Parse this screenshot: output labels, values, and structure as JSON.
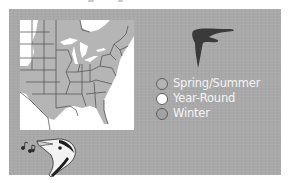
{
  "figure": {
    "title_cropped": "",
    "panel_color": "#a9a9a9",
    "map": {
      "region": "Eastern United States",
      "range_fill": "#b5b5b5",
      "background_fill": "#ffffff",
      "border_color": "#4a4a4a"
    },
    "icons": {
      "flight_silhouette": "swift-silhouette-icon",
      "bird_head": "singing-bird-head-icon",
      "music_notes": "music-notes-icon"
    },
    "legend": {
      "items": [
        {
          "label": "Spring/Summer",
          "swatch": "#b3b3b3"
        },
        {
          "label": "Year-Round",
          "swatch": "#ffffff"
        },
        {
          "label": "Winter",
          "swatch": "#a3a3a3"
        }
      ]
    }
  }
}
